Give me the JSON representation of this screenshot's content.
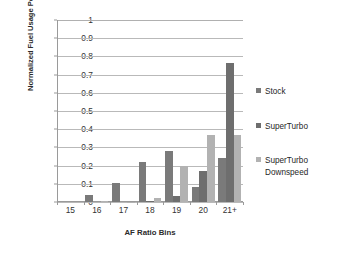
{
  "chart_data": {
    "type": "bar",
    "title": "",
    "xlabel": "AF Ratio Bins",
    "ylabel": "Normalized Fuel Usage Per Bin",
    "categories": [
      "15",
      "16",
      "17",
      "18",
      "19",
      "20",
      "21+"
    ],
    "ylim": [
      0,
      1
    ],
    "yticks": [
      "0",
      "0.1",
      "0.2",
      "0.3",
      "0.4",
      "0.5",
      "0.6",
      "0.7",
      "0.8",
      "0.9",
      "1"
    ],
    "grid": "horizontal",
    "legend_position": "right",
    "series": [
      {
        "name": "Stock",
        "color": "#7a7a7a",
        "values": [
          0,
          0.037,
          0.103,
          0.218,
          0.282,
          0.082,
          0.243
        ]
      },
      {
        "name": "SuperTurbo",
        "color": "#6e6e6e",
        "values": [
          0,
          0,
          0,
          0.003,
          0.035,
          0.168,
          0.765
        ]
      },
      {
        "name": "SuperTurbo Downspeed",
        "color": "#b2b2b2",
        "values": [
          0,
          0.003,
          0.002,
          0.024,
          0.199,
          0.366,
          0.368
        ]
      }
    ]
  },
  "legend": {
    "items": [
      {
        "label": "Stock"
      },
      {
        "label": "SuperTurbo"
      },
      {
        "label": "SuperTurbo\nDownspeed"
      }
    ]
  }
}
